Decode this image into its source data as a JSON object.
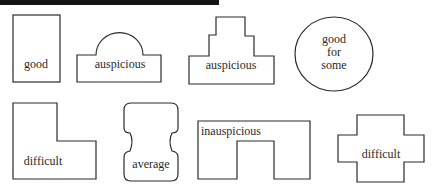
{
  "diagram": {
    "type": "plot-shapes-auspiciousness",
    "shapes": [
      {
        "id": "rectangle",
        "label": "good"
      },
      {
        "id": "dome",
        "label": "auspicious"
      },
      {
        "id": "stepped",
        "label": "auspicious"
      },
      {
        "id": "circle",
        "label_lines": [
          "good",
          "for",
          "some"
        ]
      },
      {
        "id": "l-shape",
        "label": "difficult"
      },
      {
        "id": "pinched",
        "label": "average"
      },
      {
        "id": "u-shape",
        "label": "inauspicious"
      },
      {
        "id": "cross",
        "label": "difficult"
      }
    ],
    "colors": {
      "stroke": "#2a2a2a",
      "background": "#ffffff",
      "header_bar": "#141414"
    }
  }
}
